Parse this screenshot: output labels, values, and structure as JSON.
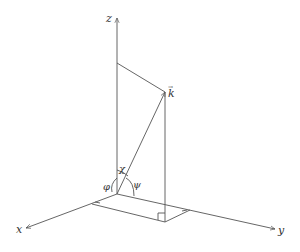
{
  "diagram": {
    "axes": {
      "z_label": "z",
      "x_label": "x",
      "y_label": "y"
    },
    "vector_label": "k",
    "vector_arrow_mark": "→",
    "angles": {
      "chi": "χ",
      "phi_left": "φ",
      "psi": "ψ"
    },
    "colors": {
      "line": "#555555",
      "text": "#333333",
      "background": "#ffffff"
    }
  }
}
